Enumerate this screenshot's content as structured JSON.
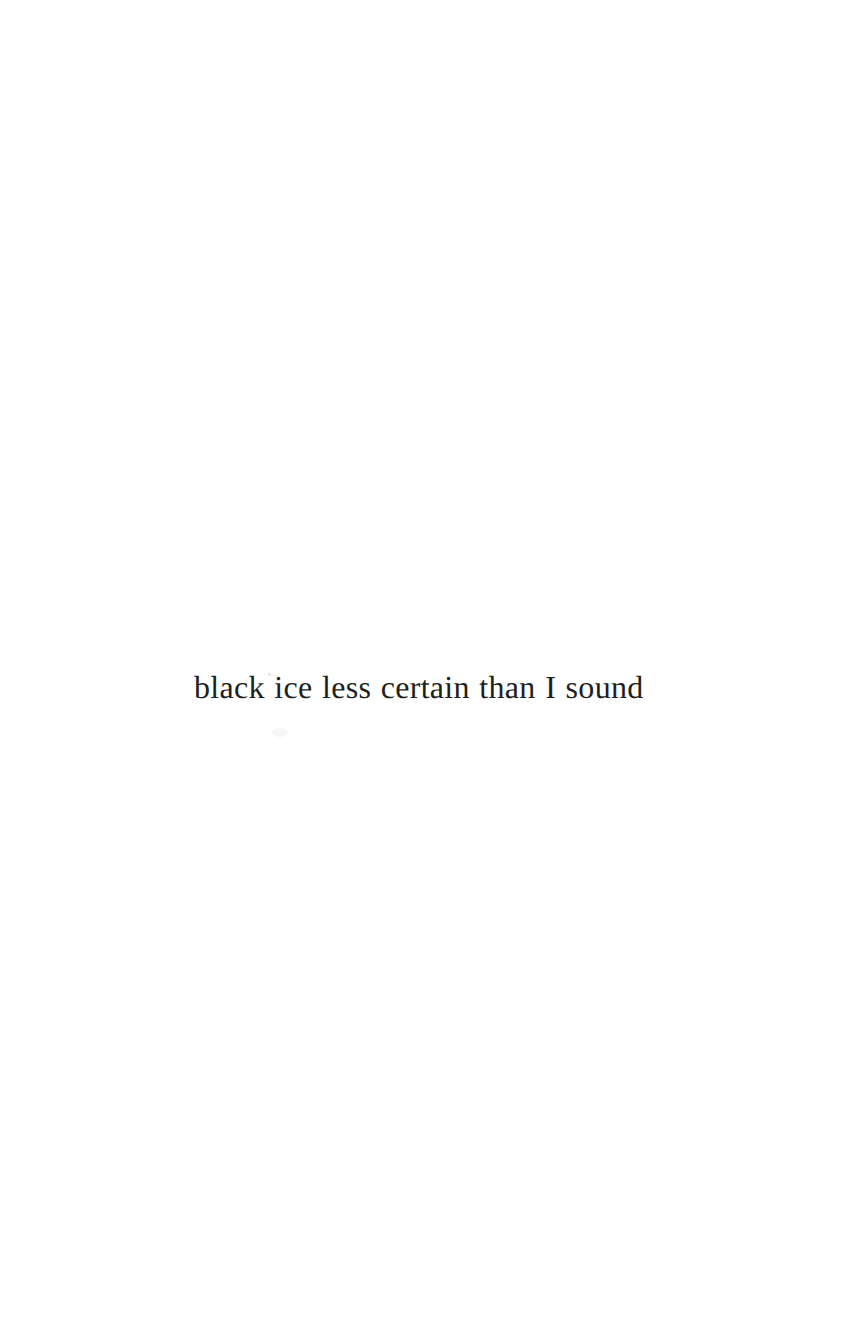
{
  "page": {
    "width": 864,
    "height": 1339,
    "background_color": "#ffffff",
    "ink_color": "#1f1f22"
  },
  "content": {
    "verse_line": "black ice less certain than I sound"
  },
  "artifacts": {
    "speck_label": "",
    "smudge_label": ""
  }
}
